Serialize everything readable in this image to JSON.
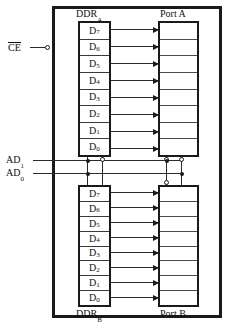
{
  "diagram": {
    "frame": {
      "name": "chip-boundary"
    },
    "colors": {
      "line": "#1a1a1a",
      "wire": "#2a2a2a",
      "background": "#ffffff",
      "text": "#111111"
    }
  },
  "blocks": {
    "ddr_a": {
      "label": "DDR",
      "subscript": "A",
      "label_position": "above",
      "cells": [
        {
          "label": "D",
          "subscript": "7"
        },
        {
          "label": "D",
          "subscript": "6"
        },
        {
          "label": "D",
          "subscript": "5"
        },
        {
          "label": "D",
          "subscript": "4"
        },
        {
          "label": "D",
          "subscript": "3"
        },
        {
          "label": "D",
          "subscript": "2"
        },
        {
          "label": "D",
          "subscript": "1"
        },
        {
          "label": "D",
          "subscript": "0"
        }
      ]
    },
    "ddr_b": {
      "label": "DDR",
      "subscript": "B",
      "label_position": "below",
      "cells": [
        {
          "label": "D",
          "subscript": "7"
        },
        {
          "label": "D",
          "subscript": "6"
        },
        {
          "label": "D",
          "subscript": "5"
        },
        {
          "label": "D",
          "subscript": "4"
        },
        {
          "label": "D",
          "subscript": "3"
        },
        {
          "label": "D",
          "subscript": "2"
        },
        {
          "label": "D",
          "subscript": "1"
        },
        {
          "label": "D",
          "subscript": "0"
        }
      ]
    },
    "port_a": {
      "label": "Port A",
      "label_position": "above",
      "cell_count": 8
    },
    "port_b": {
      "label": "Port B",
      "label_position": "below",
      "cell_count": 8
    }
  },
  "pins": [
    {
      "id": "ce",
      "label": "CE",
      "overbar": true,
      "active_low": true,
      "bubble": true
    },
    {
      "id": "ad1",
      "label": "AD",
      "subscript": "1",
      "overbar": false,
      "bubble": false
    },
    {
      "id": "ad0",
      "label": "AD",
      "subscript": "0",
      "overbar": false,
      "bubble": false
    }
  ],
  "connections": {
    "ddr_a_to_port_a": {
      "count": 8,
      "style": "arrow",
      "direction": "right"
    },
    "ddr_b_to_port_b": {
      "count": 8,
      "style": "arrow",
      "direction": "right"
    }
  }
}
